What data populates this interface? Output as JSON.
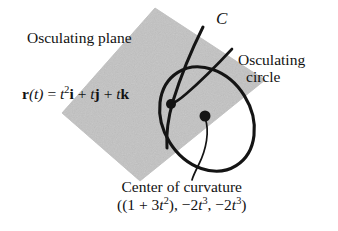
{
  "figure": {
    "type": "math-diagram",
    "background_color": "#ffffff",
    "plane": {
      "name": "osculating plane",
      "fill_color": "#d2d2d2",
      "stroke_color": "#c4c4c4",
      "points": "155,8 265,80 140,181 62,113"
    },
    "circle": {
      "name": "osculating circle",
      "stroke_color": "#141414",
      "center_x": 207,
      "center_y": 119,
      "radius_x": 44,
      "radius_y": 55,
      "rotation_deg": -32
    },
    "curve": {
      "name": "curve C",
      "stroke_color": "#141414",
      "path": "M 203,27 C 194,45 182,72 173,101 C 168,118 166,133 167,148"
    },
    "tangent_line": {
      "name": "tangent line",
      "stroke_color": "#141414",
      "path": "M 232,49 C 218,64 200,82 186,94 C 179,100 174,103 171,104"
    },
    "leader_line": {
      "name": "leader to center of curvature",
      "stroke_color": "#141414",
      "path": "M 205,118 C 210,131 206,150 199,164 C 195,172 193,176 192,180"
    },
    "point_on_curve": {
      "name": "point on curve",
      "x": 171,
      "y": 104,
      "radius": 5,
      "color": "#141414"
    },
    "center_point": {
      "name": "center of curvature point",
      "x": 205,
      "y": 116,
      "radius": 5.5,
      "color": "#141414"
    }
  },
  "labels": {
    "osculating_plane": "Osculating plane",
    "osculating_circle_line1": "Osculating",
    "osculating_circle_line2": "circle",
    "curve_name": "C",
    "vector_equation": {
      "lhs_r": "r",
      "lhs_arg": "(t)",
      "equals": " = ",
      "term1_base": "t",
      "term1_exp": "2",
      "term1_unit": "i",
      "plus1": " + ",
      "term2_base": "t",
      "term2_unit": "j",
      "plus2": " + ",
      "term3_base": "t",
      "term3_unit": "k"
    },
    "center_caption_line1": "Center of curvature",
    "center_caption_line2": {
      "open": "((1 + 3",
      "t1": "t",
      "t1_exp": "2",
      "mid": "), −2",
      "t2": "t",
      "t2_exp": "3",
      "mid2": ", −2",
      "t3": "t",
      "t3_exp": "3",
      "close": ")"
    }
  }
}
